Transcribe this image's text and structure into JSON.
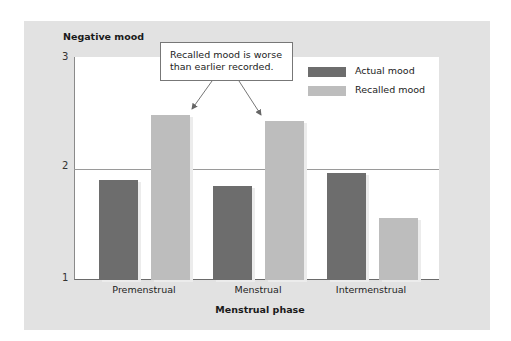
{
  "chart_data": {
    "type": "bar",
    "title": "",
    "ylabel": "Negative mood",
    "xlabel": "Menstrual phase",
    "ylim": [
      1,
      3
    ],
    "yticks": [
      1,
      2,
      3
    ],
    "categories": [
      "Premenstrual",
      "Menstrual",
      "Intermenstrual"
    ],
    "series": [
      {
        "name": "Actual mood",
        "color": "#6d6d6d",
        "values": [
          1.9,
          1.84,
          1.96
        ]
      },
      {
        "name": "Recalled mood",
        "color": "#bdbdbd",
        "values": [
          2.48,
          2.43,
          1.56
        ]
      }
    ],
    "grid": {
      "y": [
        2
      ]
    },
    "legend_position": "upper right",
    "annotation": {
      "line1": "Recalled mood is worse",
      "line2": "than earlier recorded.",
      "points_to": [
        "Premenstrual Recalled mood",
        "Menstrual Recalled mood"
      ]
    }
  },
  "labels": {
    "ylabel": "Negative mood",
    "xlabel": "Menstrual phase",
    "yticks": [
      "1",
      "2",
      "3"
    ],
    "categories": [
      "Premenstrual",
      "Menstrual",
      "Intermenstrual"
    ],
    "legend": [
      "Actual mood",
      "Recalled mood"
    ],
    "callout_line1": "Recalled mood is worse",
    "callout_line2": "than earlier recorded."
  }
}
